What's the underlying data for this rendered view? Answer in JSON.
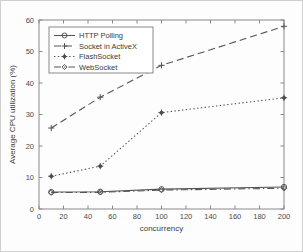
{
  "chart_data": {
    "type": "line",
    "title": "",
    "xlabel": "concurrency",
    "ylabel": "Average CPU utilization (%)",
    "x": [
      10,
      50,
      100,
      200
    ],
    "xlim": [
      0,
      200
    ],
    "ylim": [
      0,
      60
    ],
    "xticks": [
      0,
      20,
      40,
      60,
      80,
      100,
      120,
      140,
      160,
      180,
      200
    ],
    "yticks": [
      0,
      10,
      20,
      30,
      40,
      50,
      60
    ],
    "xtick_labels": [
      "0",
      "20",
      "40",
      "60",
      "80",
      "100",
      "120",
      "140",
      "160",
      "180",
      "200"
    ],
    "ytick_labels": [
      "0",
      "10",
      "20",
      "30",
      "40",
      "50",
      "60"
    ],
    "grid": false,
    "legend_position": "upper left",
    "series": [
      {
        "name": "HTTP Polling",
        "values": [
          5.4,
          5.5,
          6.3,
          7.0
        ],
        "linestyle": "solid",
        "marker": "circle",
        "color": "#555555"
      },
      {
        "name": "Socket in ActiveX",
        "values": [
          25.7,
          35.5,
          45.6,
          58.0
        ],
        "linestyle": "dashed",
        "marker": "plus",
        "color": "#555555"
      },
      {
        "name": "FlashSocket",
        "values": [
          10.4,
          13.6,
          30.6,
          35.3
        ],
        "linestyle": "dotted",
        "marker": "plus-filled",
        "color": "#555555"
      },
      {
        "name": "WebSocket",
        "values": [
          5.2,
          5.3,
          6.0,
          6.6
        ],
        "linestyle": "dashdot",
        "marker": "diamond",
        "color": "#777777"
      }
    ]
  },
  "legend": {
    "entries": [
      {
        "label": "HTTP Polling"
      },
      {
        "label": "Socket in ActiveX"
      },
      {
        "label": "FlashSocket"
      },
      {
        "label": "WebSocket"
      }
    ]
  }
}
